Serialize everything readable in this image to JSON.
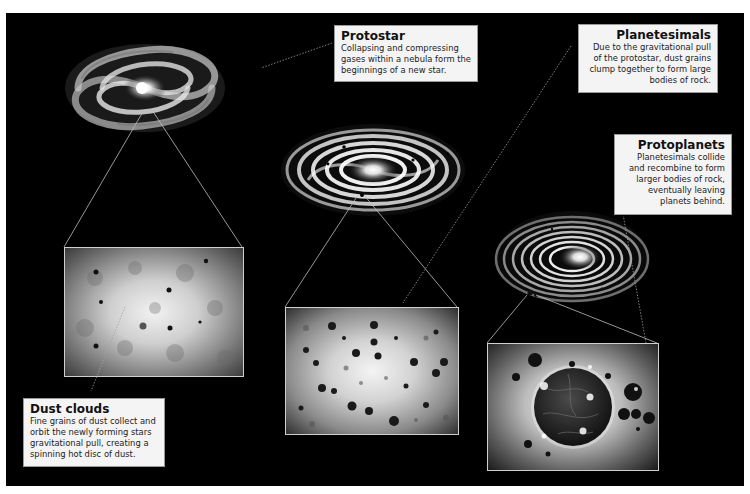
{
  "diagram": {
    "background_color": "#000000",
    "stages": [
      {
        "id": "protostar",
        "title": "Protostar",
        "description": "Collapsing and compressing gases within a nebula form the beginnings of a new star.",
        "image": "spiral-galaxy-protostar"
      },
      {
        "id": "planetesimals",
        "title": "Planetesimals",
        "description": "Due to the gravitational pull of the protostar, dust grains clump together to form large bodies of rock.",
        "image": "spiral-galaxy-planetesimals"
      },
      {
        "id": "protoplanets",
        "title": "Protoplanets",
        "description": "Planetesimals collide and recombine to form larger bodies of rock, eventually leaving planets behind.",
        "image": "spiral-galaxy-protoplanets"
      },
      {
        "id": "dust-clouds",
        "title": "Dust clouds",
        "description": "Fine grains of dust collect and orbit the newly forming stars gravitational pull, creating a spinning hot disc of dust.",
        "image": "dust-cloud-closeup"
      }
    ],
    "insets": [
      {
        "id": "dust-cloud-inset",
        "depicts": "diffuse dust cloud with scattered grains"
      },
      {
        "id": "planetesimal-inset",
        "depicts": "many dark rocky clumps against bright glow"
      },
      {
        "id": "protoplanet-inset",
        "depicts": "rocky planet surrounded by debris"
      }
    ]
  }
}
